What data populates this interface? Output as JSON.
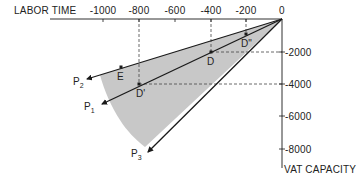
{
  "diagram": {
    "x_axis": {
      "label": "LABOR TIME",
      "ticks": [
        {
          "label": "-1000",
          "value": -1000
        },
        {
          "label": "-800",
          "value": -800
        },
        {
          "label": "-600",
          "value": -600
        },
        {
          "label": "-400",
          "value": -400
        },
        {
          "label": "-200",
          "value": -200
        },
        {
          "label": "0",
          "value": 0
        }
      ]
    },
    "y_axis": {
      "label": "VAT CAPACITY",
      "ticks": [
        {
          "label": "-2000",
          "value": -2000
        },
        {
          "label": "-4000",
          "value": -4000
        },
        {
          "label": "-6000",
          "value": -6000
        },
        {
          "label": "-8000",
          "value": -8000
        }
      ]
    },
    "points": {
      "D2": {
        "label": "D\"",
        "x": -200,
        "y": -1000
      },
      "D": {
        "label": "D",
        "x": -400,
        "y": -2000
      },
      "D1": {
        "label": "D'",
        "x": -800,
        "y": -4000
      },
      "E": {
        "label": "E",
        "x": -900,
        "y": -3000
      }
    },
    "rays": {
      "P1": {
        "base": "P",
        "sub": "1"
      },
      "P2": {
        "base": "P",
        "sub": "2"
      },
      "P3": {
        "base": "P",
        "sub": "3"
      }
    },
    "colors": {
      "line": "#1a1a1a",
      "shade": "#c8c8c8",
      "dash": "#444444"
    }
  }
}
